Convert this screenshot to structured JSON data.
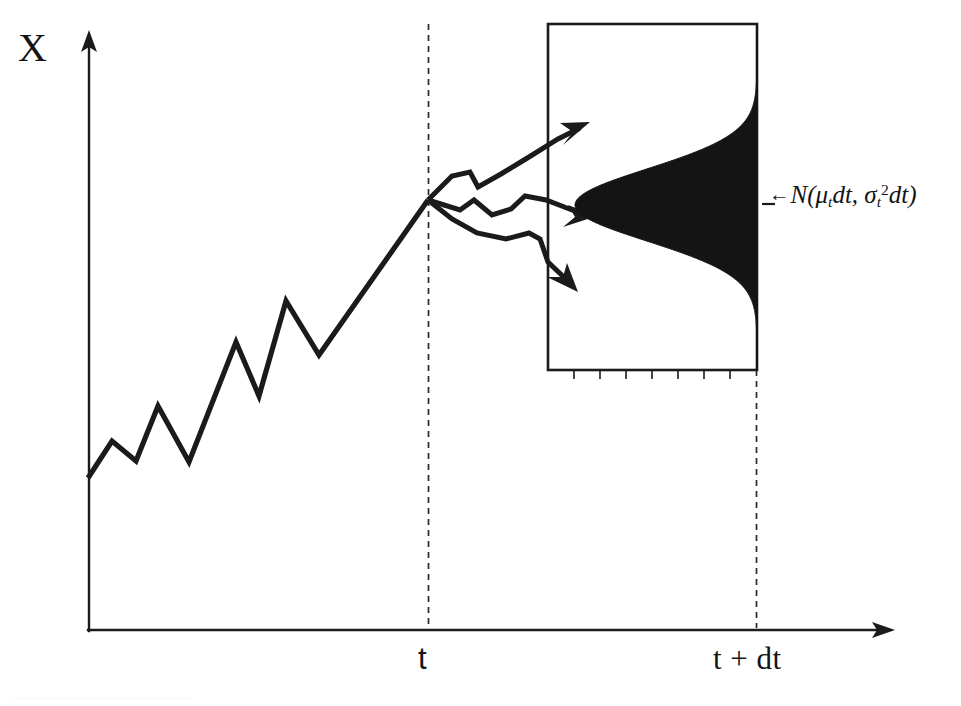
{
  "figure": {
    "kind": "ito-process-diagram",
    "background_color": "#ffffff",
    "ink_color": "#1b1b1b"
  },
  "axes": {
    "y_axis_label": "X",
    "x_axis_ticks": [
      {
        "id": "t",
        "label": "t",
        "x_px": 428
      },
      {
        "id": "t_plus_dt",
        "label": "t + dt",
        "x_px": 755
      }
    ],
    "origin_px": [
      88,
      631
    ],
    "y_axis_top_px": 32,
    "x_axis_right_px": 893
  },
  "annotation": {
    "arrow_glyph": "←",
    "distribution_name": "N",
    "open_paren": "(",
    "mean_symbol": "μ",
    "mean_subscript": "t",
    "mean_factor": "dt",
    "separator": ", ",
    "sd_symbol": "σ",
    "sd_subscript": "t",
    "sd_exponent": "2",
    "sd_factor": "dt",
    "close_paren": ")",
    "full_text": "←N(μtdt, σt²dt)"
  },
  "chart_data": {
    "type": "line",
    "title": "",
    "xlabel": "",
    "ylabel": "X",
    "grid": false,
    "legend": null,
    "series": [
      {
        "name": "realized-random-walk",
        "style": "polyline",
        "points_px": [
          [
            88,
            478
          ],
          [
            112,
            441
          ],
          [
            136,
            461
          ],
          [
            158,
            406
          ],
          [
            189,
            462
          ],
          [
            236,
            342
          ],
          [
            259,
            396
          ],
          [
            286,
            301
          ],
          [
            319,
            355
          ],
          [
            428,
            200
          ]
        ]
      },
      {
        "name": "branch-up",
        "style": "polyline-arrow",
        "points_px": [
          [
            428,
            200
          ],
          [
            452,
            176
          ],
          [
            470,
            172
          ],
          [
            478,
            186
          ],
          [
            500,
            174
          ],
          [
            527,
            157
          ],
          [
            556,
            140
          ],
          [
            584,
            126
          ]
        ]
      },
      {
        "name": "branch-middle",
        "style": "polyline-arrow",
        "points_px": [
          [
            428,
            200
          ],
          [
            460,
            209
          ],
          [
            474,
            200
          ],
          [
            492,
            214
          ],
          [
            510,
            209
          ],
          [
            524,
            196
          ],
          [
            544,
            199
          ],
          [
            572,
            209
          ],
          [
            592,
            214
          ]
        ]
      },
      {
        "name": "branch-down",
        "style": "polyline-arrow",
        "points_px": [
          [
            428,
            200
          ],
          [
            452,
            219
          ],
          [
            476,
            233
          ],
          [
            505,
            239
          ],
          [
            528,
            233
          ],
          [
            540,
            238
          ],
          [
            548,
            262
          ],
          [
            574,
            286
          ]
        ]
      }
    ],
    "distribution": {
      "family": "normal",
      "orientation": "vertical-density-drawn-leftward",
      "baseline_x_px": 757,
      "center_y_px": 205,
      "sigma_px": 36,
      "peak_extent_px": 182,
      "fill_color": "#141414",
      "label": "←N(μtdt, σt²dt)"
    },
    "distribution_box_px": {
      "x": 548,
      "y": 24,
      "width": 209,
      "height": 346
    },
    "guides": [
      {
        "name": "t-guide",
        "x_px": 428,
        "y_top_px": 24,
        "y_bottom_px": 628,
        "dashed": true
      },
      {
        "name": "t-plus-dt-guide",
        "x_px": 756,
        "y_top_px": 370,
        "y_bottom_px": 628,
        "dashed": true
      }
    ]
  }
}
